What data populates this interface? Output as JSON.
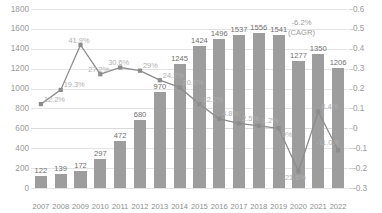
{
  "chart_data": {
    "type": "bar",
    "title": "",
    "subtitle": "",
    "xlabel": "",
    "ylabel": "",
    "y2label": "",
    "categories": [
      "2007",
      "2008",
      "2009",
      "2010",
      "2011",
      "2012",
      "2013",
      "2014",
      "2015",
      "2016",
      "2017",
      "2018",
      "2019",
      "2020",
      "2021",
      "2022"
    ],
    "grid": true,
    "legend": "none",
    "ylim": [
      0,
      1800
    ],
    "yticks": [
      0,
      200,
      400,
      600,
      800,
      1000,
      1200,
      1400,
      1600,
      1800
    ],
    "y2lim": [
      -0.3,
      0.6
    ],
    "y2ticks": [
      "-0.3",
      "-0.2",
      "-0.1",
      "0",
      "0.1",
      "0.2",
      "0.3",
      "0.4",
      "0.5",
      "0.6"
    ],
    "series": [
      {
        "name": "Volume",
        "type": "bar",
        "axis": "left",
        "color": "#9d9d9d",
        "values": [
          122,
          139,
          172,
          297,
          472,
          680,
          970,
          1245,
          1424,
          1496,
          1537,
          1556,
          1541,
          1277,
          1350,
          1206
        ],
        "labels": [
          "122",
          "139",
          "172",
          "297",
          "472",
          "680",
          "970",
          "1245",
          "1424",
          "1496",
          "1537",
          "1556",
          "1541",
          "1277",
          "1350",
          "1206"
        ]
      },
      {
        "name": "Growth rate",
        "type": "line",
        "axis": "right",
        "color": "#8c8c8c",
        "values": [
          0.122,
          0.193,
          0.419,
          0.272,
          0.306,
          0.29,
          0.242,
          0.206,
          0.122,
          0.048,
          0.025,
          0.012,
          0.0,
          -0.216,
          0.084,
          -0.11
        ],
        "labels": [
          "12.2%",
          "19.3%",
          "41.9%",
          "27.2%",
          "30.6%",
          "29%",
          "24.2%",
          "20.6%",
          "12.2%",
          "4.8%",
          "2.5%",
          "1.2%",
          "0%",
          "-21.6%",
          "8.4%",
          "-11.0%"
        ]
      }
    ],
    "annotations": [
      {
        "name": "cagr-annotation",
        "line1": "-6.2%",
        "line2": "(CAGR)"
      }
    ]
  }
}
